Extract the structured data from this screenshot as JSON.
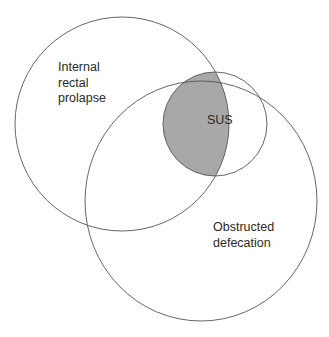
{
  "diagram": {
    "type": "venn",
    "sets": [
      {
        "id": "internal-rectal-prolapse",
        "label_lines": [
          "Internal",
          "rectal",
          "prolapse"
        ],
        "shape": {
          "cx": 122,
          "cy": 124,
          "rx": 107,
          "ry": 107
        }
      },
      {
        "id": "sus",
        "label_lines": [
          "SUS"
        ],
        "shape": {
          "cx": 215,
          "cy": 124,
          "rx": 52,
          "ry": 52
        }
      },
      {
        "id": "obstructed-defecation",
        "label_lines": [
          "Obstructed",
          "defecation"
        ],
        "shape": {
          "cx": 201,
          "cy": 201,
          "rx": 116,
          "ry": 120
        }
      }
    ],
    "highlighted_region": {
      "description": "Overlap of Internal rectal prolapse and SUS",
      "fill": "#a8a8a8"
    },
    "colors": {
      "stroke": "#555555",
      "background": "#ffffff",
      "text": "#2a2a2a"
    }
  },
  "labels": {
    "irp": {
      "line1": "Internal",
      "line2": "rectal",
      "line3": "prolapse"
    },
    "sus": {
      "line1": "SUS"
    },
    "od": {
      "line1": "Obstructed",
      "line2": "defecation"
    }
  }
}
